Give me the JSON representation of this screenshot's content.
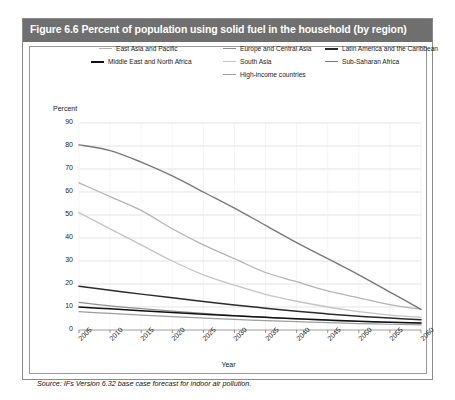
{
  "figure": {
    "title": "Figure 6.6 Percent of population using solid fuel in the household (by region)",
    "source": "Source: IFs Version 6.32 base case forecast for indoor air pollution."
  },
  "chart_data": {
    "type": "line",
    "title": "Figure 6.6 Percent of population using solid fuel in the household (by region)",
    "xlabel": "Year",
    "ylabel": "Percent",
    "xlim": [
      2005,
      2060
    ],
    "ylim": [
      0,
      90
    ],
    "ytick_step": 10,
    "grid": true,
    "legend_position": "top",
    "x": [
      2005,
      2010,
      2015,
      2020,
      2025,
      2030,
      2035,
      2040,
      2045,
      2050,
      2055,
      2060
    ],
    "yticks": [
      "0",
      "10",
      "20",
      "30",
      "40",
      "50",
      "60",
      "70",
      "80",
      "90"
    ],
    "xticks": [
      "2005",
      "2010",
      "2015",
      "2020",
      "2025",
      "2030",
      "2035",
      "2040",
      "2045",
      "2050",
      "2055",
      "2060"
    ],
    "series": [
      {
        "name": "East Asia and Pacific",
        "color": "#b4b4b4",
        "width": 1.3,
        "values": [
          64,
          58,
          52,
          44,
          37,
          31,
          25,
          21,
          17,
          14,
          11,
          9
        ]
      },
      {
        "name": "Europe and Central Asia",
        "color": "#8f8f8f",
        "width": 1.2,
        "values": [
          12,
          10.5,
          9.3,
          8.2,
          7.2,
          6.3,
          5.5,
          4.8,
          4.2,
          3.7,
          3.3,
          3.0
        ]
      },
      {
        "name": "Latin America and the Caribbean",
        "color": "#2b2b2b",
        "width": 1.5,
        "values": [
          19,
          17.3,
          15.6,
          14.0,
          12.4,
          10.9,
          9.5,
          8.2,
          7.0,
          6.0,
          5.2,
          4.5
        ]
      },
      {
        "name": "Middle East and North Africa",
        "color": "#111111",
        "width": 1.5,
        "values": [
          10,
          9.2,
          8.4,
          7.6,
          6.9,
          6.2,
          5.5,
          4.9,
          4.3,
          3.8,
          3.4,
          3.0
        ]
      },
      {
        "name": "South Asia",
        "color": "#c4c4c4",
        "width": 1.3,
        "values": [
          51,
          44,
          37,
          30,
          24,
          19.5,
          15.5,
          12.5,
          10,
          8,
          6.5,
          5.5
        ]
      },
      {
        "name": "Sub-Saharan Africa",
        "color": "#787878",
        "width": 1.4,
        "values": [
          80.5,
          78,
          73,
          67,
          60,
          53,
          45.5,
          38,
          31,
          24,
          16.5,
          9
        ]
      },
      {
        "name": "High-income countries",
        "color": "#9e9e9e",
        "width": 1.2,
        "values": [
          8,
          7.2,
          6.5,
          5.8,
          5.2,
          4.6,
          4.1,
          3.6,
          3.2,
          2.8,
          2.5,
          2.2
        ]
      }
    ]
  },
  "legend": {
    "items": [
      {
        "label": "East Asia and Pacific",
        "color": "#b4b4b4",
        "thickness": "1.2px"
      },
      {
        "label": "Europe and Central Asia",
        "color": "#8f8f8f",
        "thickness": "1.4px"
      },
      {
        "label": "Latin America and the Caribbean",
        "color": "#2b2b2b",
        "thickness": "2px"
      },
      {
        "label": "Middle East and North Africa",
        "color": "#111111",
        "thickness": "2px"
      },
      {
        "label": "South Asia",
        "color": "#c4c4c4",
        "thickness": "1.2px"
      },
      {
        "label": "Sub-Saharan Africa",
        "color": "#787878",
        "thickness": "1.6px"
      },
      {
        "label": "High-income countries",
        "color": "#9e9e9e",
        "thickness": "1.4px"
      }
    ]
  },
  "colors": {
    "title_bar_bg": "#6f6f6f",
    "frame_border": "#8a8a8a",
    "grid": "#d8d8d8"
  }
}
